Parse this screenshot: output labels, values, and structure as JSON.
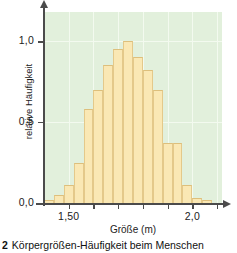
{
  "caption": {
    "number": "2",
    "text": "Körpergrößen-Häufigkeit beim Menschen"
  },
  "chart_data": {
    "type": "bar",
    "title": "",
    "xlabel": "Größe (m)",
    "ylabel": "relative Häufigkeit",
    "xlim": [
      1.4,
      2.12
    ],
    "ylim": [
      0.0,
      1.18
    ],
    "grid": true,
    "legend": "none",
    "bar_width": 0.04,
    "plot_background": "#e2f0dc",
    "bar_fill": "#fae8b4",
    "bar_edge": "#e4c98a",
    "axis_color": "#4b4b4b",
    "x": [
      1.42,
      1.46,
      1.5,
      1.54,
      1.58,
      1.62,
      1.66,
      1.7,
      1.74,
      1.78,
      1.82,
      1.86,
      1.9,
      1.94,
      1.98,
      2.02,
      2.06
    ],
    "values": [
      0.02,
      0.05,
      0.11,
      0.25,
      0.58,
      0.7,
      0.85,
      0.95,
      1.0,
      0.9,
      0.82,
      0.7,
      0.37,
      0.37,
      0.11,
      0.03,
      0.02
    ],
    "ytick_values": [
      0.0,
      0.5,
      1.0
    ],
    "ytick_labels": [
      "0,0",
      "0,5",
      "1,0"
    ],
    "xtick_values": [
      1.5,
      1.6,
      1.7,
      1.8,
      1.9,
      2.0,
      2.1
    ],
    "xtick_labels": [
      "1,50",
      "",
      "",
      "",
      "",
      "2,0",
      ""
    ]
  }
}
